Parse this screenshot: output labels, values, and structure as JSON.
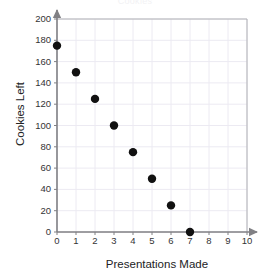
{
  "chart_data": {
    "type": "scatter",
    "title": "Cookies",
    "title_note": "title is clipped off the top edge of the screenshot and nearly invisible",
    "xlabel": "Presentations Made",
    "ylabel": "Cookies Left",
    "x": [
      0,
      1,
      2,
      3,
      4,
      5,
      6,
      7
    ],
    "values": [
      175,
      150,
      125,
      100,
      75,
      50,
      25,
      0
    ],
    "points": [
      {
        "x": 0,
        "y": 175
      },
      {
        "x": 1,
        "y": 150
      },
      {
        "x": 2,
        "y": 125
      },
      {
        "x": 3,
        "y": 100
      },
      {
        "x": 4,
        "y": 75
      },
      {
        "x": 5,
        "y": 50
      },
      {
        "x": 6,
        "y": 25
      },
      {
        "x": 7,
        "y": 0
      }
    ],
    "xlim": [
      0,
      10
    ],
    "ylim": [
      0,
      200
    ],
    "xticks": [
      "0",
      "1",
      "2",
      "3",
      "4",
      "5",
      "6",
      "7",
      "8",
      "9",
      "10"
    ],
    "yticks": [
      "0",
      "20",
      "40",
      "60",
      "80",
      "100",
      "120",
      "140",
      "160",
      "180",
      "200"
    ],
    "xtick_values": [
      0,
      1,
      2,
      3,
      4,
      5,
      6,
      7,
      8,
      9,
      10
    ],
    "ytick_values": [
      0,
      20,
      40,
      60,
      80,
      100,
      120,
      140,
      160,
      180,
      200
    ],
    "grid": true,
    "legend": false,
    "marker": "filled-circle",
    "marker_color": "#111111",
    "grid_color": "#eceaf2",
    "axis_color": "#808084",
    "plot_border_color": "#b0b0b4",
    "background_color": "#ffffff",
    "text_color": "#222224"
  }
}
